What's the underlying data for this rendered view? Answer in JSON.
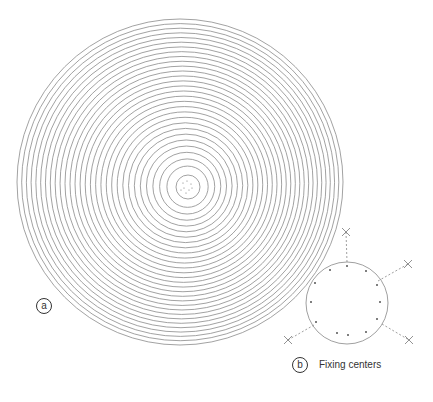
{
  "figure": {
    "panel_a": {
      "label": "a",
      "description": "concentric eccentric circles"
    },
    "panel_b": {
      "label": "b",
      "caption": "Fixing centers"
    }
  },
  "colors": {
    "line": "#8a8a8a",
    "text": "#333333"
  }
}
